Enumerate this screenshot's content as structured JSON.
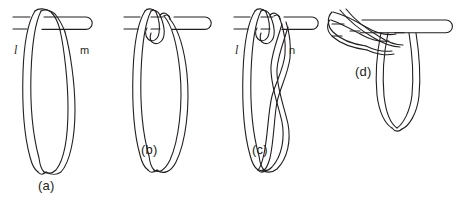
{
  "figure": {
    "kind": "line-diagram",
    "stroke_color": "#231f20",
    "fill_color": "#ffffff",
    "background": "#ffffff",
    "stroke_width": 1.1,
    "panels": [
      {
        "id": "a",
        "caption": "(a)",
        "labels": [
          {
            "id": "l",
            "text": "l",
            "style": "italic"
          },
          {
            "id": "m",
            "text": "m",
            "style": "roman"
          }
        ]
      },
      {
        "id": "b",
        "caption": "(b)",
        "labels": []
      },
      {
        "id": "c",
        "caption": "(c)",
        "labels": [
          {
            "id": "l",
            "text": "l",
            "style": "italic"
          },
          {
            "id": "n",
            "text": "n",
            "style": "roman"
          }
        ]
      },
      {
        "id": "d",
        "caption": "(d)",
        "labels": []
      }
    ]
  }
}
